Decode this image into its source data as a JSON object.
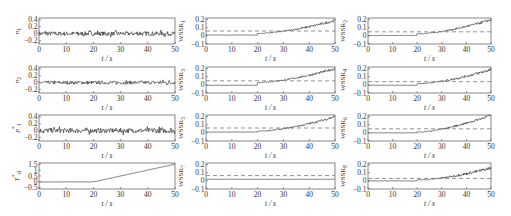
{
  "figure": {
    "background": "#ffffff",
    "axis_color": "#555555",
    "line_color": "#222222",
    "threshold_color": "#666666"
  },
  "chart_data": [
    {
      "id": "n1",
      "type": "line",
      "ylabel": "n",
      "ylabel_sub": "1",
      "ylabel_star": false,
      "xlabel": "t / s",
      "xlim": [
        0,
        50
      ],
      "ylim": [
        -0.3,
        0.45
      ],
      "xticks": [
        0,
        10,
        20,
        30,
        40,
        50
      ],
      "yticks": [
        -0.2,
        0,
        0.2,
        0.4
      ],
      "ytick_labels": [
        "-0.2",
        "0",
        "0.2",
        "0.4"
      ],
      "signal": {
        "kind": "noise",
        "mean": 0,
        "amp": 0.06
      },
      "threshold": null,
      "grid": false,
      "legend": null
    },
    {
      "id": "n2",
      "type": "line",
      "ylabel": "n",
      "ylabel_sub": "2",
      "ylabel_star": false,
      "xlabel": "t / s",
      "xlim": [
        0,
        50
      ],
      "ylim": [
        -0.3,
        0.45
      ],
      "xticks": [
        0,
        10,
        20,
        30,
        40,
        50
      ],
      "yticks": [
        -0.2,
        0,
        0.2,
        0.4
      ],
      "ytick_labels": [
        "-0.2",
        "0",
        "0.2",
        "0.4"
      ],
      "signal": {
        "kind": "noise",
        "mean": 0,
        "amp": 0.05
      },
      "threshold": null,
      "grid": false,
      "legend": null
    },
    {
      "id": "p1",
      "type": "line",
      "ylabel": "p",
      "ylabel_sub": "1",
      "ylabel_star": true,
      "xlabel": "t / s",
      "xlim": [
        0,
        50
      ],
      "ylim": [
        -0.3,
        0.45
      ],
      "xticks": [
        0,
        10,
        20,
        30,
        40,
        50
      ],
      "yticks": [
        -0.2,
        0,
        0.2,
        0.4
      ],
      "ytick_labels": [
        "-0.2",
        "0",
        "0.2",
        "0.4"
      ],
      "signal": {
        "kind": "noise",
        "mean": 0,
        "amp": 0.07
      },
      "threshold": null,
      "grid": false,
      "legend": null
    },
    {
      "id": "Tsl",
      "type": "line",
      "ylabel": "T",
      "ylabel_sub": "sl",
      "ylabel_star": true,
      "xlabel": "t / s",
      "xlim": [
        0,
        50
      ],
      "ylim": [
        -0.6,
        1.6
      ],
      "xticks": [
        0,
        10,
        20,
        30,
        40,
        50
      ],
      "yticks": [
        -0.5,
        0,
        0.5,
        1,
        1.5
      ],
      "ytick_labels": [
        "-0.5",
        "0",
        "0.5",
        "1",
        "1.5"
      ],
      "signal": {
        "kind": "ramp",
        "start_t": 20,
        "start_v": 0,
        "end_t": 50,
        "end_v": 1.5,
        "amp": 0.02
      },
      "threshold": null,
      "grid": false,
      "legend": null
    },
    {
      "id": "WSSR1",
      "type": "line",
      "ylabel": "WSSR",
      "ylabel_sub": "1",
      "ylabel_star": false,
      "xlabel": "t / s",
      "xlim": [
        0,
        50
      ],
      "ylim": [
        -0.1,
        0.22
      ],
      "xticks": [
        0,
        10,
        20,
        30,
        40,
        50
      ],
      "yticks": [
        -0.1,
        0,
        0.1,
        0.2
      ],
      "ytick_labels": [
        "-0.1",
        "0",
        "0.1",
        "0.2"
      ],
      "signal": {
        "kind": "rise",
        "start_t": 20,
        "base": 0.01,
        "jump": 0.02,
        "end_v": 0.19,
        "amp": 0.012
      },
      "threshold": 0.06,
      "grid": false,
      "legend": null
    },
    {
      "id": "WSSR2",
      "type": "line",
      "ylabel": "WSSR",
      "ylabel_sub": "2",
      "ylabel_star": false,
      "xlabel": "t / s",
      "xlim": [
        0,
        50
      ],
      "ylim": [
        -0.1,
        0.22
      ],
      "xticks": [
        0,
        10,
        20,
        30,
        40,
        50
      ],
      "yticks": [
        -0.1,
        0,
        0.1,
        0.2
      ],
      "ytick_labels": [
        "-0.1",
        "0",
        "0.1",
        "0.2"
      ],
      "signal": {
        "kind": "rise",
        "start_t": 20,
        "base": 0.005,
        "jump": 0.02,
        "end_v": 0.2,
        "amp": 0.012
      },
      "threshold": 0.05,
      "grid": false,
      "legend": null
    },
    {
      "id": "WSSR3",
      "type": "line",
      "ylabel": "WSSR",
      "ylabel_sub": "3",
      "ylabel_star": false,
      "xlabel": "t / s",
      "xlim": [
        0,
        50
      ],
      "ylim": [
        -0.1,
        0.22
      ],
      "xticks": [
        0,
        10,
        20,
        30,
        40,
        50
      ],
      "yticks": [
        -0.1,
        0,
        0.1,
        0.2
      ],
      "ytick_labels": [
        "-0.1",
        "0",
        "0.1",
        "0.2"
      ],
      "signal": {
        "kind": "rise",
        "start_t": 20,
        "base": -0.005,
        "jump": 0.035,
        "end_v": 0.2,
        "amp": 0.012
      },
      "threshold": 0.05,
      "grid": false,
      "legend": null
    },
    {
      "id": "WSSR4",
      "type": "line",
      "ylabel": "WSSR",
      "ylabel_sub": "4",
      "ylabel_star": false,
      "xlabel": "t / s",
      "xlim": [
        0,
        50
      ],
      "ylim": [
        -0.1,
        0.22
      ],
      "xticks": [
        0,
        10,
        20,
        30,
        40,
        50
      ],
      "yticks": [
        -0.1,
        0,
        0.1,
        0.2
      ],
      "ytick_labels": [
        "-0.1",
        "0",
        "0.1",
        "0.2"
      ],
      "signal": {
        "kind": "rise",
        "start_t": 20,
        "base": -0.005,
        "jump": 0.02,
        "end_v": 0.19,
        "amp": 0.014
      },
      "threshold": 0.04,
      "grid": false,
      "legend": null
    },
    {
      "id": "WSSR5",
      "type": "line",
      "ylabel": "WSSR",
      "ylabel_sub": "5",
      "ylabel_star": false,
      "xlabel": "t / s",
      "xlim": [
        0,
        50
      ],
      "ylim": [
        -0.1,
        0.22
      ],
      "xticks": [
        0,
        10,
        20,
        30,
        40,
        50
      ],
      "yticks": [
        -0.1,
        0,
        0.1,
        0.2
      ],
      "ytick_labels": [
        "-0.1",
        "0",
        "0.1",
        "0.2"
      ],
      "signal": {
        "kind": "rise",
        "start_t": 20,
        "base": 0.01,
        "jump": 0.01,
        "end_v": 0.2,
        "amp": 0.012
      },
      "threshold": 0.06,
      "grid": false,
      "legend": null
    },
    {
      "id": "WSSR6",
      "type": "line",
      "ylabel": "WSSR",
      "ylabel_sub": "6",
      "ylabel_star": false,
      "xlabel": "t / s",
      "xlim": [
        0,
        50
      ],
      "ylim": [
        -0.1,
        0.22
      ],
      "xticks": [
        0,
        10,
        20,
        30,
        40,
        50
      ],
      "yticks": [
        -0.1,
        0,
        0.1,
        0.2
      ],
      "ytick_labels": [
        "-0.1",
        "0",
        "0.1",
        "0.2"
      ],
      "signal": {
        "kind": "rise",
        "start_t": 20,
        "base": 0.0,
        "jump": 0.01,
        "end_v": 0.22,
        "amp": 0.012
      },
      "threshold": 0.05,
      "grid": false,
      "legend": null
    },
    {
      "id": "WSSR7",
      "type": "line",
      "ylabel": "WSSR",
      "ylabel_sub": "7",
      "ylabel_star": false,
      "xlabel": "t / s",
      "xlim": [
        0,
        50
      ],
      "ylim": [
        -0.1,
        0.22
      ],
      "xticks": [
        0,
        10,
        20,
        30,
        40,
        50
      ],
      "yticks": [
        -0.1,
        0,
        0.1,
        0.2
      ],
      "ytick_labels": [
        "-0.1",
        "0",
        "0.1",
        "0.2"
      ],
      "signal": {
        "kind": "flat",
        "mean": 0.02,
        "amp": 0.002
      },
      "threshold": 0.065,
      "grid": false,
      "legend": null
    },
    {
      "id": "WSSR8",
      "type": "line",
      "ylabel": "WSSR",
      "ylabel_sub": "8",
      "ylabel_star": false,
      "xlabel": "t / s",
      "xlim": [
        0,
        50
      ],
      "ylim": [
        -0.1,
        0.22
      ],
      "xticks": [
        0,
        10,
        20,
        30,
        40,
        50
      ],
      "yticks": [
        -0.1,
        0,
        0.1,
        0.2
      ],
      "ytick_labels": [
        "-0.1",
        "0",
        "0.1",
        "0.2"
      ],
      "signal": {
        "kind": "rise",
        "start_t": 20,
        "base": 0.0,
        "jump": 0.01,
        "end_v": 0.16,
        "amp": 0.014
      },
      "threshold": 0.03,
      "grid": false,
      "legend": null
    }
  ],
  "layout": {
    "panels": [
      {
        "id": "n1",
        "x": 39,
        "y": 18,
        "w": 136,
        "h": 26
      },
      {
        "id": "n2",
        "x": 39,
        "y": 67,
        "w": 136,
        "h": 26
      },
      {
        "id": "p1",
        "x": 39,
        "y": 115,
        "w": 136,
        "h": 26
      },
      {
        "id": "Tsl",
        "x": 39,
        "y": 163,
        "w": 136,
        "h": 26
      },
      {
        "id": "WSSR1",
        "x": 206,
        "y": 18,
        "w": 129,
        "h": 26
      },
      {
        "id": "WSSR3",
        "x": 206,
        "y": 67,
        "w": 129,
        "h": 26
      },
      {
        "id": "WSSR5",
        "x": 206,
        "y": 115,
        "w": 129,
        "h": 26
      },
      {
        "id": "WSSR7",
        "x": 206,
        "y": 163,
        "w": 129,
        "h": 26
      },
      {
        "id": "WSSR2",
        "x": 368,
        "y": 18,
        "w": 123,
        "h": 26
      },
      {
        "id": "WSSR4",
        "x": 368,
        "y": 67,
        "w": 123,
        "h": 26
      },
      {
        "id": "WSSR6",
        "x": 368,
        "y": 115,
        "w": 123,
        "h": 26
      },
      {
        "id": "WSSR8",
        "x": 368,
        "y": 163,
        "w": 123,
        "h": 26
      }
    ]
  }
}
